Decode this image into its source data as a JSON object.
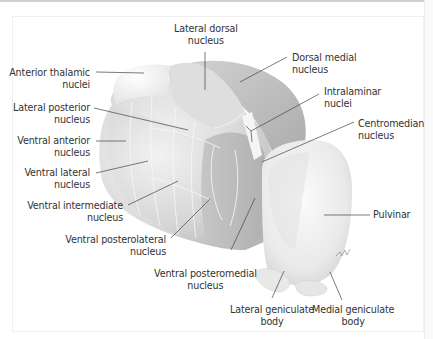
{
  "figure": {
    "colors": {
      "background": "#ffffff",
      "label_text": "#333333",
      "leader_line": "#444444",
      "structure_light": "#e8e8e8",
      "structure_mid": "#c9c9c9",
      "structure_dark": "#a8a8a8",
      "boundary_lines": "#f4f4f4"
    },
    "labels": [
      {
        "id": "lateral-dorsal",
        "line1": "Lateral dorsal",
        "line2": "nucleus"
      },
      {
        "id": "dorsal-medial",
        "line1": "Dorsal medial",
        "line2": "nucleus"
      },
      {
        "id": "anterior-thalamic",
        "line1": "Anterior thalamic",
        "line2": "nuclei"
      },
      {
        "id": "intralaminar",
        "line1": "Intralaminar",
        "line2": "nuclei"
      },
      {
        "id": "lateral-posterior",
        "line1": "Lateral posterior",
        "line2": "nucleus"
      },
      {
        "id": "centromedian",
        "line1": "Centromedian",
        "line2": "nucleus"
      },
      {
        "id": "ventral-anterior",
        "line1": "Ventral anterior",
        "line2": "nucleus"
      },
      {
        "id": "ventral-lateral",
        "line1": "Ventral lateral",
        "line2": "nucleus"
      },
      {
        "id": "ventral-intermediate",
        "line1": "Ventral intermediate",
        "line2": "nucleus"
      },
      {
        "id": "pulvinar",
        "line1": "Pulvinar",
        "line2": ""
      },
      {
        "id": "ventral-posterolateral",
        "line1": "Ventral posterolateral",
        "line2": "nucleus"
      },
      {
        "id": "ventral-posteromedial",
        "line1": "Ventral posteromedial",
        "line2": "nucleus"
      },
      {
        "id": "lateral-geniculate",
        "line1": "Lateral geniculate",
        "line2": "body"
      },
      {
        "id": "medial-geniculate",
        "line1": "Medial geniculate",
        "line2": "body"
      }
    ]
  }
}
